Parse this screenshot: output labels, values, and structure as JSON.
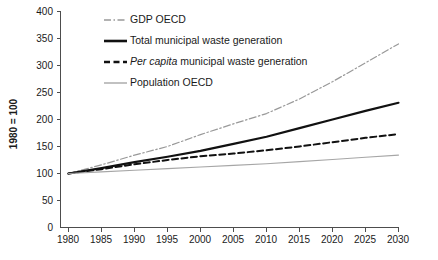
{
  "chart_data": {
    "type": "line",
    "title": "",
    "subtitle": "",
    "xlabel": "",
    "ylabel": "1980 = 100",
    "xlim": [
      1980,
      2030
    ],
    "ylim": [
      0,
      400
    ],
    "ytick_step": 50,
    "xtick_step": 5,
    "grid": false,
    "legend_position": "top-left",
    "xticks": [
      "1980",
      "1985",
      "1990",
      "1995",
      "2000",
      "2005",
      "2010",
      "2015",
      "2020",
      "2025",
      "2030"
    ],
    "yticks": [
      "0",
      "50",
      "100",
      "150",
      "200",
      "250",
      "300",
      "350",
      "400"
    ],
    "x": [
      1980,
      1985,
      1990,
      1995,
      2000,
      2005,
      2010,
      2015,
      2020,
      2025,
      2030
    ],
    "series": [
      {
        "name": "GDP OECD",
        "style": "dash-dot",
        "color": "#999999",
        "width": 1.2,
        "values": [
          100,
          116,
          134,
          150,
          172,
          192,
          211,
          238,
          270,
          305,
          340
        ]
      },
      {
        "name": "Total municipal waste generation",
        "style": "solid",
        "color": "#111111",
        "width": 2.2,
        "values": [
          100,
          110,
          121,
          131,
          142,
          155,
          168,
          184,
          200,
          216,
          231
        ]
      },
      {
        "name": "Per capita municipal waste generation",
        "style": "dashed",
        "color": "#111111",
        "width": 2.0,
        "values": [
          100,
          108,
          117,
          125,
          132,
          137,
          143,
          150,
          158,
          166,
          173
        ]
      },
      {
        "name": "Population OECD",
        "style": "solid",
        "color": "#a6a6a6",
        "width": 1.1,
        "values": [
          100,
          103,
          106,
          109,
          112,
          115,
          118,
          122,
          126,
          130,
          134
        ]
      }
    ]
  },
  "legend": {
    "items": [
      {
        "label": "GDP OECD",
        "italic_prefix": ""
      },
      {
        "label": "Total municipal waste generation",
        "italic_prefix": ""
      },
      {
        "label": " municipal waste generation",
        "italic_prefix": "Per capita"
      },
      {
        "label": "Population OECD",
        "italic_prefix": ""
      }
    ]
  }
}
